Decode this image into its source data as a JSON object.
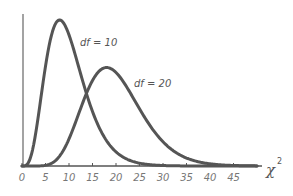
{
  "chart_data": {
    "type": "line",
    "title": "",
    "xlabel": "χ²",
    "ylabel": "",
    "xlim": [
      0,
      50
    ],
    "grid": false,
    "x_ticks": [
      "0",
      "5",
      "10",
      "15",
      "20",
      "25",
      "30",
      "35",
      "40",
      "45"
    ],
    "series": [
      {
        "name": "df = 10",
        "df": 10,
        "distribution": "chi-square",
        "peak_x": 8,
        "color": "#555555"
      },
      {
        "name": "df = 20",
        "df": 20,
        "distribution": "chi-square",
        "peak_x": 18,
        "color": "#555555"
      }
    ],
    "annotations": [
      {
        "text": "df = 10",
        "near_x": 13
      },
      {
        "text": "df = 20",
        "near_x": 24
      }
    ]
  },
  "labels": {
    "df10": "df = 10",
    "df20": "df = 20",
    "xaxis": "χ",
    "xaxis_sup": "2"
  },
  "colors": {
    "curve": "#555555",
    "axis": "#555555",
    "text": "#777777"
  }
}
